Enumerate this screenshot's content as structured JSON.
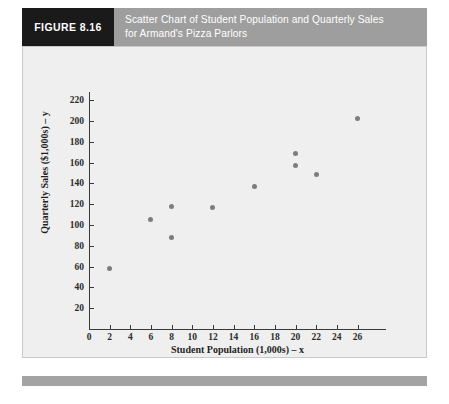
{
  "figure": {
    "tag": "FIGURE 8.16",
    "caption_line1": "Scatter Chart of Student Population and Quarterly Sales",
    "caption_line2": "for Armand's Pizza Parlors",
    "tag_background": "#1a1a1a",
    "band_background": "#9e9e9e",
    "panel_background": "#efefef",
    "footer_background": "#a3a3a3"
  },
  "chart_data": {
    "type": "scatter",
    "title": "Scatter Chart of Student Population and Quarterly Sales for Armand's Pizza Parlors",
    "xlabel": "Student Population (1,000s) – x",
    "ylabel": "Quarterly Sales ($1,000s) – y",
    "xlim": [
      0,
      27.5
    ],
    "ylim": [
      0,
      224
    ],
    "xticks": [
      0,
      2,
      4,
      6,
      8,
      10,
      12,
      14,
      16,
      18,
      20,
      22,
      24,
      26
    ],
    "yticks": [
      0,
      20,
      40,
      60,
      80,
      100,
      120,
      140,
      160,
      180,
      200,
      220
    ],
    "xticklabels": [
      "0",
      "2",
      "4",
      "6",
      "8",
      "10",
      "12",
      "14",
      "16",
      "18",
      "20",
      "22",
      "24",
      "26"
    ],
    "yticklabels": [
      "0",
      "20",
      "40",
      "60",
      "80",
      "100",
      "120",
      "140",
      "160",
      "180",
      "200",
      "220"
    ],
    "grid": false,
    "legend": null,
    "marker_color": "#7d7d7d",
    "series": [
      {
        "name": "Restaurants",
        "x": [
          2,
          6,
          8,
          8,
          12,
          16,
          20,
          20,
          22,
          26
        ],
        "y": [
          58,
          105,
          88,
          118,
          117,
          137,
          157,
          169,
          149,
          202
        ],
        "points": [
          {
            "x": 2,
            "y": 58
          },
          {
            "x": 6,
            "y": 105
          },
          {
            "x": 8,
            "y": 88
          },
          {
            "x": 8,
            "y": 118
          },
          {
            "x": 12,
            "y": 117
          },
          {
            "x": 16,
            "y": 137
          },
          {
            "x": 20,
            "y": 157
          },
          {
            "x": 20,
            "y": 169
          },
          {
            "x": 22,
            "y": 149
          },
          {
            "x": 26,
            "y": 202
          }
        ]
      }
    ]
  }
}
